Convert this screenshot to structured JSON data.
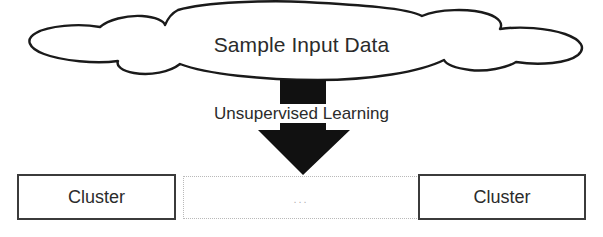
{
  "diagram": {
    "cloud": {
      "label": "Sample Input Data",
      "shape": "cloud-shape",
      "stroke_color": "#1a1a1a",
      "fill_color": "#ffffff"
    },
    "arrow": {
      "label": "Unsupervised Learning",
      "direction": "down",
      "color": "#111111",
      "icon": "down-arrow-icon"
    },
    "outputs": [
      {
        "label": "Cluster",
        "style": "solid",
        "border_color": "#3b3b3b"
      },
      {
        "label": "...",
        "style": "dotted",
        "border_color": "#b9b9b9"
      },
      {
        "label": "Cluster",
        "style": "solid",
        "border_color": "#3b3b3b"
      }
    ]
  }
}
